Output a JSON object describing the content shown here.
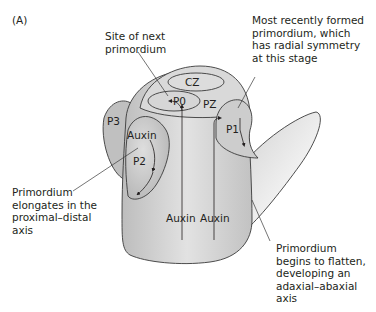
{
  "panel_label": "(A)",
  "annotations": {
    "site_next": [
      "Site of next",
      "primordium"
    ],
    "most_recent": [
      "Most recently formed",
      "primordium, which",
      "has radial symmetry",
      "at this stage"
    ],
    "elongates": [
      "Primordium",
      "elongates in the",
      "proximal–distal",
      "axis"
    ],
    "flatten": [
      "Primordium",
      "begins to flatten,",
      "developing an",
      "adaxial–abaxial",
      "axis"
    ]
  },
  "regions": {
    "cz": "CZ",
    "pz": "PZ",
    "p0": "P0",
    "p1": "P1",
    "p2": "P2",
    "p3": "P3"
  },
  "auxin_labels": {
    "p2": "Auxin",
    "left": "Auxin",
    "right": "Auxin"
  },
  "colors": {
    "body_fill": "#d4d4d4",
    "dome_fill": "#dcdcdc",
    "primordium_fill": "#c4c4c4",
    "outline": "#3a3a3a",
    "text": "#231f20"
  }
}
